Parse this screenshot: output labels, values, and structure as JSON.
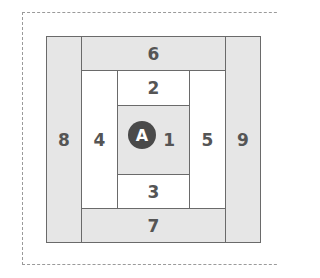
{
  "diagram": {
    "title": "",
    "blocks": [
      {
        "id": "1",
        "label": "1"
      },
      {
        "id": "2",
        "label": "2"
      },
      {
        "id": "3",
        "label": "3"
      },
      {
        "id": "4",
        "label": "4"
      },
      {
        "id": "5",
        "label": "5"
      },
      {
        "id": "6",
        "label": "6"
      },
      {
        "id": "7",
        "label": "7"
      },
      {
        "id": "8",
        "label": "8"
      },
      {
        "id": "9",
        "label": "9"
      }
    ],
    "marker": {
      "label": "A"
    },
    "colors": {
      "fill_gray": "#e6e6e6",
      "fill_white": "#ffffff",
      "border": "#6a6a6a",
      "text": "#555555",
      "marker": "#4a4a4a",
      "dashed": "#9a9a9a"
    }
  }
}
